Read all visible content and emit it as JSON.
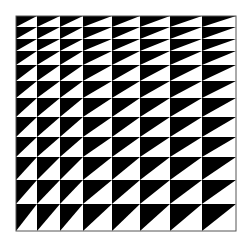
{
  "figure": {
    "colors": {
      "fill": "#000000",
      "background": "#ffffff",
      "border": "#555555"
    },
    "columns_x": [
      16,
      37,
      60,
      83,
      112,
      140,
      170,
      202,
      236
    ],
    "rows_y": [
      16,
      27,
      39,
      51,
      65,
      81,
      98,
      117,
      137,
      157,
      180,
      204,
      231
    ],
    "column_count": 8,
    "row_count": 12
  }
}
